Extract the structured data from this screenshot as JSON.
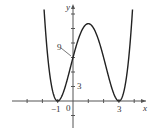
{
  "chart_data": {
    "type": "line",
    "title": "",
    "xlabel": "x",
    "ylabel": "y",
    "function": "y = (x+1)^2 (x-3)^2",
    "x_ticks_labeled": [
      "-1",
      "3"
    ],
    "y_ticks_labeled": [
      "3"
    ],
    "origin_label": "0",
    "annotations": [
      {
        "text": "9",
        "points_to": [
          0,
          9
        ]
      }
    ],
    "points": [
      [
        -1,
        0
      ],
      [
        0,
        9
      ],
      [
        1,
        16
      ],
      [
        3,
        0
      ]
    ],
    "xlim": [
      -4,
      4.5
    ],
    "ylim": [
      -6,
      20
    ],
    "grid": false
  },
  "labels": {
    "x_axis": "x",
    "y_axis": "y",
    "origin": "0",
    "tick_neg1": "−1",
    "tick_3": "3",
    "ytick_3": "3",
    "annotation_9": "9"
  }
}
